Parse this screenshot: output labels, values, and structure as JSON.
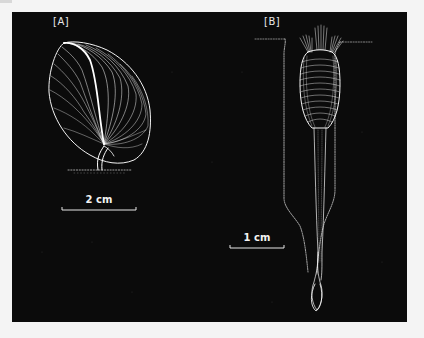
{
  "figure": {
    "background_color": "#f4f4f4",
    "panel_color": "#0b0b0b",
    "line_color": "#ffffff",
    "panels": [
      {
        "id": "A",
        "label": "[A]",
        "description": "ovoid shell with radiating growth lines attached by a short stalk to a dotted substrate line",
        "scale_bar": {
          "label": "2 cm"
        }
      },
      {
        "id": "B",
        "label": "[B]",
        "description": "elongate shell with setae fans at top, set in a dotted burrow with long pedicle ending in a bulb",
        "scale_bar": {
          "label": "1 cm"
        }
      }
    ]
  }
}
